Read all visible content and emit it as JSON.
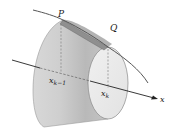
{
  "figure": {
    "labels": {
      "P": "P",
      "Q": "Q",
      "x_prev_base": "x",
      "x_prev_sub": "k−1",
      "x_k_base": "x",
      "x_k_sub": "k",
      "axis": "x"
    },
    "colors": {
      "surface_light": "#e6e6e6",
      "surface_mid": "#cfcfcf",
      "surface_dark": "#a8a8a8",
      "band": "#8f8f8f",
      "curve": "#555555",
      "axis": "#222222",
      "dash": "#777777"
    }
  }
}
